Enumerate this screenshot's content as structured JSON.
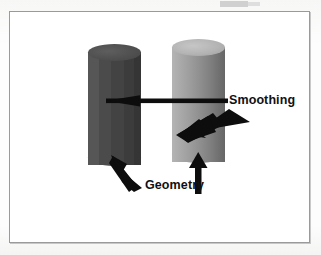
{
  "figure": {
    "type": "3d-shading-comparison-diagram",
    "background_color": "#ffffff",
    "page_color": "#fbfbfa",
    "frame_color": "#9a9a9a",
    "objects": [
      {
        "name": "left-cylinder",
        "semantic": "geometry",
        "shading": "flat-faceted",
        "fill_color": "#4a4a4a",
        "highlight_color": "#5e5e5e",
        "shadow_color": "#353535"
      },
      {
        "name": "right-cylinder",
        "semantic": "smoothing",
        "shading": "smooth-gouraud",
        "fill_color": "#9a9a9a",
        "highlight_color": "#c6c6c6",
        "shadow_color": "#676767"
      }
    ],
    "annotations": [
      {
        "id": "smoothing",
        "label": "Smoothing",
        "arrow_style": "horizontal-line-with-left-head",
        "points_to": "left-cylinder"
      },
      {
        "id": "smoothing-diagonal",
        "label": "Smoothing",
        "arrow_style": "thick-diagonal-down-left",
        "points_to": "right-cylinder"
      },
      {
        "id": "geometry-left",
        "label": "Geometry",
        "arrow_style": "diagonal-up-right",
        "points_to": "left-cylinder-base"
      },
      {
        "id": "geometry-right",
        "label": "Geometry",
        "arrow_style": "vertical-up",
        "points_to": "right-cylinder-base"
      }
    ],
    "labels": {
      "smoothing": "Smoothing",
      "geometry": "Geometry"
    }
  }
}
